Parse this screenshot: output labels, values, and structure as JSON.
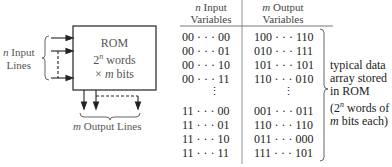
{
  "diagram": {
    "rom_block": {
      "line1": "ROM",
      "line2_base": "2",
      "line2_exp": "n",
      "line2_rest": " words",
      "line3_prefix": "× ",
      "line3_var": "m",
      "line3_rest": " bits"
    },
    "input_label": {
      "var": "n",
      "line1_rest": " Input",
      "line2": "Lines"
    },
    "output_label": {
      "var": "m",
      "rest": " Output Lines"
    },
    "table": {
      "col1_header": {
        "var": "n",
        "line1_rest": " Input",
        "line2": "Variables"
      },
      "col2_header": {
        "var": "m",
        "line1_rest": " Output",
        "line2": "Variables"
      },
      "rows_top": [
        {
          "input": "00 · · · 00",
          "output": "100 · · · 110"
        },
        {
          "input": "00 · · · 01",
          "output": "010 · · · 111"
        },
        {
          "input": "00 · · · 10",
          "output": "101 · · · 101"
        },
        {
          "input": "00 · · · 11",
          "output": "110 · · · 010"
        }
      ],
      "ellipsis": "⋮",
      "rows_bottom": [
        {
          "input": "11 · · · 00",
          "output": "001 · · · 011"
        },
        {
          "input": "11 · · · 01",
          "output": "110 · · · 110"
        },
        {
          "input": "11 · · · 10",
          "output": "011 · · · 000"
        },
        {
          "input": "11 · · · 11",
          "output": "111 · · · 101"
        }
      ]
    },
    "annotation": {
      "line1": "typical data",
      "line2": "array stored",
      "line3": "in ROM",
      "line4_prefix": "(2",
      "line4_exp": "n",
      "line4_rest": " words of",
      "line5_var": "m",
      "line5_rest": " bits each)"
    }
  }
}
